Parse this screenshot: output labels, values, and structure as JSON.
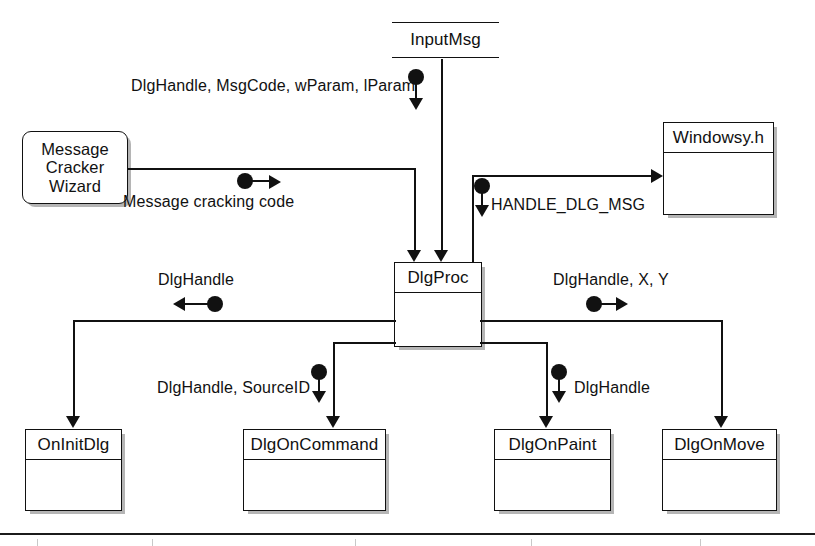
{
  "diagram": {
    "accent_color": "#111111",
    "background_color": "#ffffff",
    "nodes": [
      {
        "id": "inputmsg",
        "label": "InputMsg",
        "style": "open-box"
      },
      {
        "id": "wizard",
        "label": "Message Cracker Wizard",
        "lines": [
          "Message",
          "Cracker",
          "Wizard"
        ],
        "style": "rounded-shadow-box"
      },
      {
        "id": "windowsyh",
        "label": "Windowsy.h",
        "style": "titled-box"
      },
      {
        "id": "dlgproc",
        "label": "DlgProc",
        "style": "titled-box"
      },
      {
        "id": "oninitdlg",
        "label": "OnInitDlg",
        "style": "titled-box"
      },
      {
        "id": "dlgoncommand",
        "label": "DlgOnCommand",
        "style": "titled-box"
      },
      {
        "id": "dlgonpaint",
        "label": "DlgOnPaint",
        "style": "titled-box"
      },
      {
        "id": "dlgonmove",
        "label": "DlgOnMove",
        "style": "titled-box"
      }
    ],
    "edge_labels": [
      {
        "id": "e1",
        "text": "DlgHandle, MsgCode, wParam, lParam",
        "marker": "down",
        "from": "inputmsg",
        "to": "dlgproc"
      },
      {
        "id": "e2",
        "text": "Message cracking code",
        "marker": "right",
        "from": "wizard",
        "to": "dlgproc"
      },
      {
        "id": "e3",
        "text": "HANDLE_DLG_MSG",
        "marker": "down",
        "from": "windowsyh",
        "to": "dlgproc"
      },
      {
        "id": "e4",
        "text": "DlgHandle",
        "marker": "left",
        "from": "dlgproc",
        "to": "oninitdlg"
      },
      {
        "id": "e5",
        "text": "DlgHandle, SourceID",
        "marker": "down",
        "from": "dlgproc",
        "to": "dlgoncommand"
      },
      {
        "id": "e6",
        "text": "DlgHandle",
        "marker": "down",
        "from": "dlgproc",
        "to": "dlgonpaint"
      },
      {
        "id": "e7",
        "text": "DlgHandle, X, Y",
        "marker": "right",
        "from": "dlgproc",
        "to": "dlgonmove"
      }
    ]
  }
}
